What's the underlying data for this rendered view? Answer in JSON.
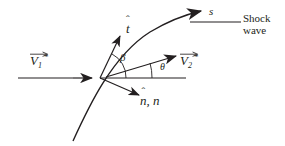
{
  "figure": {
    "width": 285,
    "height": 146,
    "background_color": "#ffffff",
    "ink_color": "#231f20"
  },
  "labels": {
    "upstream_velocity": {
      "symbol": "V",
      "subscript": "1",
      "superscript": "*",
      "accent": "vector-arrow",
      "full": "V1*"
    },
    "downstream_velocity": {
      "symbol": "V",
      "subscript": "2",
      "superscript": "*",
      "accent": "vector-arrow",
      "full": "V2*"
    },
    "tangent_unit_vector": {
      "symbol": "t",
      "accent": "hat",
      "full": "t-hat"
    },
    "normal_unit_vector": {
      "symbol": "n",
      "accent": "hat",
      "second_symbol": "n",
      "separator": ", ",
      "full": "n-hat, n"
    },
    "wave_angle": "β",
    "deflection_angle": "θ",
    "arclength_coordinate": "s",
    "shock_wave_line1": "Shock",
    "shock_wave_line2": "wave"
  },
  "geometry": {
    "stroke_color": "#231f20",
    "curve_stroke_width": 1.4,
    "line_stroke_width": 1.2,
    "origin_point": {
      "x": 100,
      "y": 78
    },
    "incoming_flow_line": {
      "x1": 18,
      "y1": 78,
      "x2": 97,
      "y2": 78
    },
    "downstream_reference_line": {
      "x1": 100,
      "y1": 78,
      "x2": 186,
      "y2": 78
    },
    "shock_curve": {
      "start": {
        "x": 73,
        "y": 141
      },
      "control1": {
        "x": 92,
        "y": 100
      },
      "control2": {
        "x": 130,
        "y": 40
      },
      "end": {
        "x": 203,
        "y": 12
      },
      "description": "curved shock wave through origin, arrowhead at upper right"
    },
    "tangent_arrow": {
      "x1": 100,
      "y1": 78,
      "x2": 119,
      "y2": 34,
      "label": "t-hat"
    },
    "normal_arrow": {
      "x1": 100,
      "y1": 78,
      "x2": 140,
      "y2": 96,
      "label": "n-hat"
    },
    "downstream_velocity_arrow": {
      "x1": 112,
      "y1": 76,
      "x2": 176,
      "y2": 56
    },
    "upstream_velocity_arrowhead": {
      "x": 85,
      "y": 78
    },
    "shock_leader_line": {
      "x1": 190,
      "y1": 22,
      "x2": 240,
      "y2": 22
    },
    "beta_arc": {
      "radius": 26,
      "from": "downstream-reference",
      "to": "tangent"
    },
    "theta_arc": {
      "radius": 46,
      "from": "downstream-reference",
      "to": "v2-arrow"
    }
  }
}
